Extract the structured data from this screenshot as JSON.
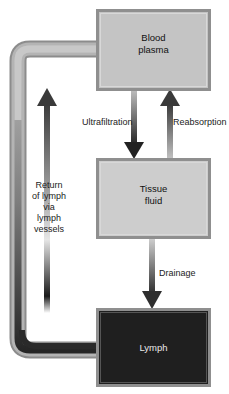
{
  "diagram": {
    "nodes": {
      "blood_plasma": {
        "label_line1": "Blood",
        "label_line2": "plasma",
        "fill": "#c4c4c4",
        "border": "#8f8f8f"
      },
      "tissue_fluid": {
        "label_line1": "Tissue",
        "label_line2": "fluid",
        "fill": "#cdcdcd",
        "border": "#8f8f8f"
      },
      "lymph": {
        "label": "Lymph",
        "fill": "#1f1f1f",
        "border": "#8f8f8f"
      }
    },
    "edges": {
      "ultrafiltration": {
        "label": "Ultrafiltration",
        "from": "Blood plasma",
        "to": "Tissue fluid"
      },
      "reabsorption": {
        "label": "Reabsorption",
        "from": "Tissue fluid",
        "to": "Blood plasma"
      },
      "drainage": {
        "label": "Drainage",
        "from": "Tissue fluid",
        "to": "Lymph"
      },
      "return": {
        "label_lines": [
          "Return",
          "of lymph",
          "via",
          "lymph",
          "vessels"
        ],
        "from": "Lymph",
        "to": "Blood plasma"
      }
    }
  }
}
